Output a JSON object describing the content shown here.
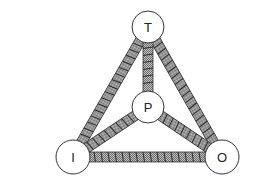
{
  "diagram": {
    "type": "tetrahedral-node-graph",
    "nodes": [
      {
        "id": "T",
        "label": "T",
        "x": 148,
        "y": 27,
        "r": 16
      },
      {
        "id": "P",
        "label": "P",
        "x": 148,
        "y": 107,
        "r": 16
      },
      {
        "id": "I",
        "label": "I",
        "x": 73,
        "y": 157,
        "r": 17
      },
      {
        "id": "O",
        "label": "O",
        "x": 222,
        "y": 157,
        "r": 17
      }
    ],
    "edges": [
      {
        "from": "T",
        "to": "I"
      },
      {
        "from": "T",
        "to": "O"
      },
      {
        "from": "T",
        "to": "P"
      },
      {
        "from": "P",
        "to": "I"
      },
      {
        "from": "P",
        "to": "O"
      },
      {
        "from": "I",
        "to": "O"
      }
    ],
    "colors": {
      "node_fill": "#ffffff",
      "node_stroke": "#333333",
      "bar_fill": "#9a9a9a",
      "bar_stroke": "#333333",
      "hatch": "#2a2a2a"
    }
  }
}
